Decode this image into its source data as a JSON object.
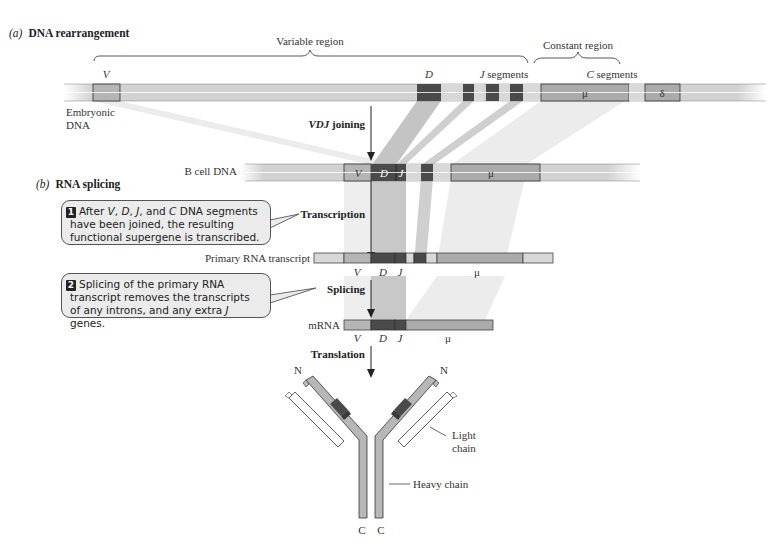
{
  "panel_a": {
    "letter": "(a)",
    "title": "DNA rearrangement",
    "variable_region_label": "Variable region",
    "constant_region_label": "Constant region",
    "v_label": "V",
    "d_label": "D",
    "j_segments_label": "J segments",
    "c_segments_label": "C segments",
    "mu_label": "μ",
    "delta_label": "δ",
    "embryonic_dna_label_line1": "Embryonic",
    "embryonic_dna_label_line2": "DNA",
    "vdj_joining_label_italic": "VDJ",
    "vdj_joining_label_rest": " joining"
  },
  "b_cell_dna": {
    "label": "B cell DNA",
    "v_label": "V",
    "d_label": "D",
    "j_label": "J",
    "mu_label": "μ"
  },
  "panel_b": {
    "letter": "(b)",
    "title": "RNA splicing",
    "step1_number": "1",
    "step1_text_parts": [
      "After ",
      "V",
      ", ",
      "D",
      ", ",
      "J",
      ", and ",
      "C",
      " DNA segments have been joined, the resulting functional supergene is transcribed."
    ],
    "transcription_label": "Transcription",
    "primary_transcript_label": "Primary RNA transcript",
    "primary_v_label": "V",
    "primary_d_label": "D",
    "primary_j_label": "J",
    "primary_mu_label": "μ",
    "step2_number": "2",
    "step2_text_parts": [
      "Splicing of the primary RNA transcript removes the transcripts of any introns, and any extra ",
      "J",
      " genes."
    ],
    "splicing_label": "Splicing",
    "mrna_label": "mRNA",
    "mrna_v_label": "V",
    "mrna_d_label": "D",
    "mrna_j_label": "J",
    "mrna_mu_label": "μ",
    "translation_label": "Translation"
  },
  "antibody": {
    "n_left": "N",
    "n_right": "N",
    "c_left": "C",
    "c_right": "C",
    "light_chain_line1": "Light",
    "light_chain_line2": "chain",
    "heavy_chain_label": "Heavy chain"
  },
  "colors": {
    "background": "#ffffff",
    "dna_light": "#d4d4d4",
    "segment_v": "#b3b3b3",
    "segment_dark": "#4a4a4a",
    "segment_mu": "#a9a9a9",
    "segment_pale": "#dcdcdc",
    "band_shade": "#e6e6e6",
    "callout_bg": "#ebebeb"
  }
}
